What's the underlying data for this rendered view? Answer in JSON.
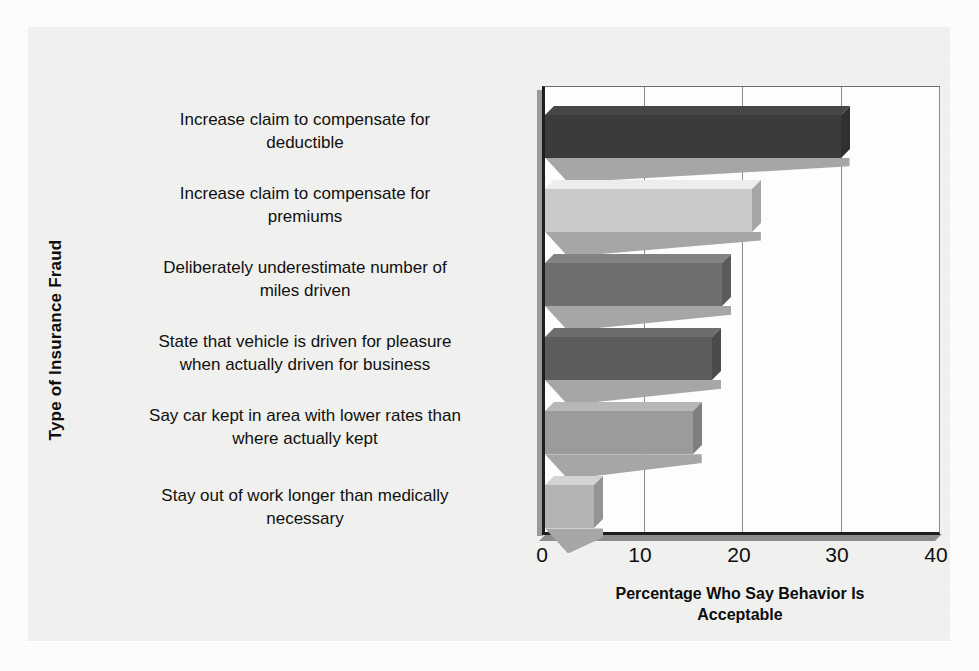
{
  "chart_data": {
    "type": "bar",
    "orientation": "horizontal",
    "title": "",
    "xlabel": "Percentage Who Say Behavior Is Acceptable",
    "ylabel": "Type of Insurance Fraud",
    "xlim": [
      0,
      40
    ],
    "xticks": [
      "0",
      "10",
      "20",
      "30",
      "40"
    ],
    "grid": "vertical",
    "legend": "none",
    "categories": [
      "Increase claim to compensate for deductible",
      "Increase claim to compensate for premiums",
      "Deliberately underestimate number of miles driven",
      "State that vehicle is driven for pleasure when actually driven for business",
      "Say car kept in area with lower rates than where actually kept",
      "Stay out of work longer than medically necessary"
    ],
    "values": [
      30,
      21,
      18,
      17,
      15,
      5
    ],
    "bar_colors": [
      "#3b3b3b",
      "#c9c9c9",
      "#6f6f6f",
      "#5c5c5c",
      "#9b9b9b",
      "#b3b3b3"
    ]
  },
  "axis": {
    "y_title": "Type of Insurance Fraud",
    "x_title_line1": "Percentage Who Say Behavior Is",
    "x_title_line2": "Acceptable"
  },
  "category_labels": [
    {
      "line1": "Increase claim to compensate for",
      "line2": "deductible"
    },
    {
      "line1": "Increase claim to compensate for",
      "line2": "premiums"
    },
    {
      "line1": "Deliberately underestimate number of",
      "line2": "miles driven"
    },
    {
      "line1": "State that vehicle is driven for pleasure",
      "line2": "when actually driven for business"
    },
    {
      "line1": "Say car kept in area with lower rates than",
      "line2": "where actually kept"
    },
    {
      "line1": "Stay out of work longer than medically",
      "line2": "necessary"
    }
  ],
  "ticks": {
    "t0": "0",
    "t1": "10",
    "t2": "20",
    "t3": "30",
    "t4": "40"
  },
  "colors": {
    "page_background": "#fdfdfd",
    "panel_background": "#f0f0ee",
    "plot_background": "#fdfdfc",
    "axis": "#1d1d1d",
    "gridline": "#8c8c8c",
    "text": "#101010",
    "shadow": "#a6a6a6"
  }
}
